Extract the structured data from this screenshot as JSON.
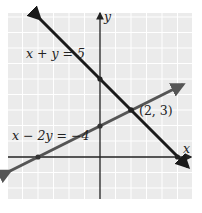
{
  "diagram": {
    "type": "linear-system-graph",
    "axes": {
      "x_label": "x",
      "y_label": "y"
    },
    "colors": {
      "background_grid": "#ebebeb",
      "grid_lines": "#ffffff",
      "axes": "#222222",
      "line1": "#1a1a1a",
      "line2": "#555555"
    },
    "lines": [
      {
        "equation": "x + y = 5",
        "label": "x + y = 5",
        "x_intercept": [
          5,
          0
        ],
        "y_intercept": [
          0,
          5
        ]
      },
      {
        "equation": "x − 2y = −4",
        "label": "x − 2y = −4",
        "x_intercept": [
          -4,
          0
        ],
        "y_intercept": [
          0,
          2
        ]
      }
    ],
    "intersection": {
      "point": [
        2,
        3
      ],
      "label": "(2, 3)"
    }
  }
}
